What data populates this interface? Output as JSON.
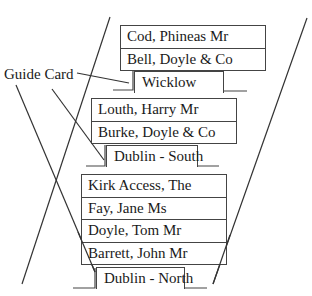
{
  "diagram": {
    "callout": {
      "label": "Guide Card"
    },
    "groups": [
      {
        "guide": "Wicklow",
        "entries": [
          "Cod, Phineas Mr",
          "Bell, Doyle & Co"
        ]
      },
      {
        "guide": "Dublin - South",
        "entries": [
          "Louth, Harry Mr",
          "Burke, Doyle & Co"
        ]
      },
      {
        "guide": "Dublin - North",
        "entries": [
          "Kirk Access, The",
          "Fay, Jane Ms",
          "Doyle, Tom Mr",
          "Barrett, John Mr"
        ]
      }
    ],
    "colors": {
      "line": "#333333",
      "border": "#444444",
      "background": "#ffffff"
    }
  }
}
